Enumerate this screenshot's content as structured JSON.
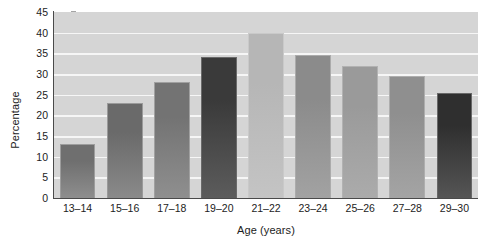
{
  "chart_data": {
    "type": "bar",
    "title": "",
    "subtitle": "",
    "xlabel": "Age (years)",
    "ylabel": "Percentage",
    "categories": [
      "13–14",
      "15–16",
      "17–18",
      "19–20",
      "21–22",
      "23–24",
      "25–26",
      "27–28",
      "29–30"
    ],
    "values": [
      13,
      23,
      28,
      34,
      40,
      34.5,
      32,
      29.5,
      25.5
    ],
    "ylim": [
      0,
      45
    ],
    "ytick_values": [
      0,
      5,
      10,
      15,
      20,
      25,
      30,
      35,
      40,
      45
    ],
    "ytick_labels": [
      "0",
      "5",
      "10",
      "15",
      "20",
      "25",
      "30",
      "35",
      "40",
      "45"
    ],
    "grid": true,
    "grid_color": "#f6f6f6",
    "grid_axis": "y",
    "legend": false,
    "legend_position": "none",
    "plot_background": "#d5d5d5",
    "figure_background": "#ffffff",
    "axis_color": "#4a4a4a",
    "text_color": "#1c1c1c",
    "bar_colors": [
      "#6f6f6f",
      "#6a6a6a",
      "#737373",
      "#3a3a3a",
      "#b6b6b6",
      "#8b8b8b",
      "#9a9a9a",
      "#8f8f8f",
      "#2f2f2f"
    ],
    "bar_colors_bottom": [
      "#8e8e8e",
      "#8a8a8a",
      "#8f8f8f",
      "#5c5c5c",
      "#c4c4c4",
      "#a2a2a2",
      "#ababab",
      "#a4a4a4",
      "#555555"
    ],
    "bar_edge_colors": [
      "#9d9d9d",
      "#9a9a9a",
      "#a0a0a0",
      "#6a6a6a",
      "#c9c9c9",
      "#ababab",
      "#b2b2b2",
      "#aeaeae",
      "#686868"
    ]
  }
}
